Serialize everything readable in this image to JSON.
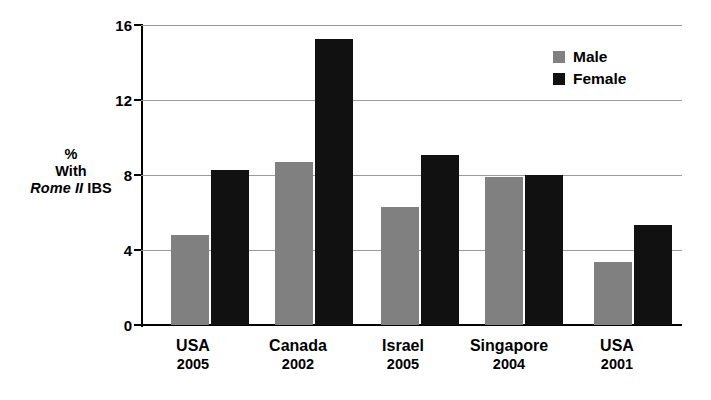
{
  "chart_data": {
    "type": "bar",
    "title": "",
    "subtitle": "",
    "xlabel": "",
    "ylabel_lines": [
      "%",
      "With",
      "Rome II IBS"
    ],
    "ylabel_line1": "%",
    "ylabel_line2": "With",
    "ylabel_line3_italic": "Rome II",
    "ylabel_line3_rest": " IBS",
    "categories": [
      "USA",
      "Canada",
      "Israel",
      "Singapore",
      "USA"
    ],
    "category_years": [
      "2005",
      "2002",
      "2005",
      "2004",
      "2001"
    ],
    "series": [
      {
        "name": "Male",
        "color": "#808080",
        "values": [
          4.8,
          8.7,
          6.3,
          7.9,
          3.35
        ]
      },
      {
        "name": "Female",
        "color": "#111111",
        "values": [
          8.3,
          15.3,
          9.1,
          8.05,
          5.35
        ]
      }
    ],
    "ylim": [
      0,
      16
    ],
    "yticks": [
      0,
      4,
      8,
      12,
      16
    ],
    "ytick_labels": [
      "0",
      "4",
      "8",
      "12",
      "16"
    ],
    "grid": true,
    "grid_axis": "y",
    "legend_position": "top-right",
    "legend_entries": [
      "Male",
      "Female"
    ]
  },
  "legend": {
    "male_label": "Male",
    "female_label": "Female"
  },
  "axis": {
    "ytick_0": "0",
    "ytick_4": "4",
    "ytick_8": "8",
    "ytick_12": "12",
    "ytick_16": "16"
  },
  "groups": [
    {
      "name": "USA",
      "year": "2005"
    },
    {
      "name": "Canada",
      "year": "2002"
    },
    {
      "name": "Israel",
      "year": "2005"
    },
    {
      "name": "Singapore",
      "year": "2004"
    },
    {
      "name": "USA",
      "year": "2001"
    }
  ]
}
